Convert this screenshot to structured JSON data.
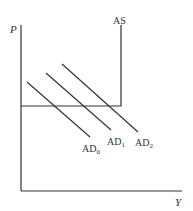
{
  "diagram": {
    "type": "AD-AS model (Keynesian reverse-L aggregate supply)",
    "axes": {
      "y_label": "P",
      "x_label": "Y"
    },
    "curves": {
      "as": {
        "label": "AS"
      },
      "ad": [
        {
          "label_base": "AD",
          "label_sub": "0"
        },
        {
          "label_base": "AD",
          "label_sub": "1"
        },
        {
          "label_base": "AD",
          "label_sub": "2"
        }
      ]
    },
    "colors": {
      "line": "#333333",
      "background": "#ffffff"
    }
  }
}
